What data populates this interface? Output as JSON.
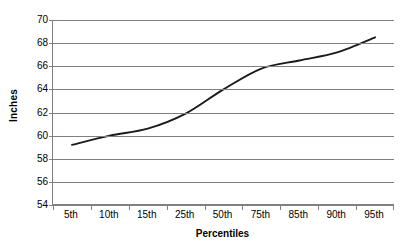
{
  "chart_data": {
    "type": "line",
    "title": "",
    "subtitle": "",
    "xlabel": "Percentiles",
    "ylabel": "Inches",
    "categories": [
      "5th",
      "10th",
      "15th",
      "25th",
      "50th",
      "75th",
      "85th",
      "90th",
      "95th"
    ],
    "values": [
      59.2,
      60.0,
      60.6,
      61.9,
      64.0,
      65.8,
      66.5,
      67.2,
      68.5
    ],
    "series": [
      {
        "name": "Height",
        "values": [
          59.2,
          60.0,
          60.6,
          61.9,
          64.0,
          65.8,
          66.5,
          67.2,
          68.5
        ]
      }
    ],
    "ylim": [
      54,
      70
    ],
    "ytick_step": 2,
    "ytick_labels": [
      "70",
      "68",
      "66",
      "64",
      "62",
      "60",
      "58",
      "56",
      "54"
    ],
    "ytick_values": [
      70,
      68,
      66,
      64,
      62,
      60,
      58,
      56,
      54
    ],
    "grid": "horizontal",
    "legend": "none",
    "line_color": "#1a1a1a",
    "gridline_color": "#808080",
    "plot_background": "#ffffff",
    "markers": "none"
  }
}
